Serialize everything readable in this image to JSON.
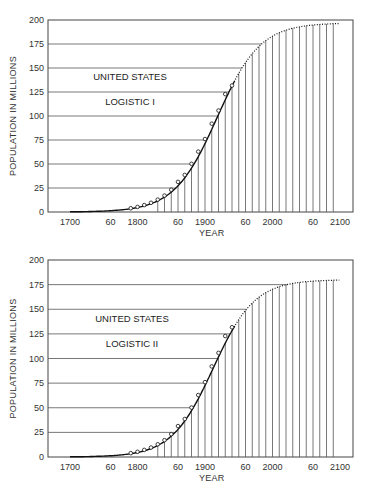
{
  "chart_data": [
    {
      "type": "line",
      "title": "UNITED STATES",
      "subtitle": "LOGISTIC I",
      "xlabel": "YEAR",
      "ylabel": "POPULATION IN MILLIONS",
      "xlim": [
        1690,
        2110
      ],
      "ylim": [
        0,
        200
      ],
      "yticks": [
        0,
        25,
        50,
        75,
        100,
        125,
        150,
        175,
        200
      ],
      "xtick_labels": [
        {
          "x": 1700,
          "label": "1700"
        },
        {
          "x": 1760,
          "label": "60"
        },
        {
          "x": 1800,
          "label": "1800"
        },
        {
          "x": 1860,
          "label": "60"
        },
        {
          "x": 1900,
          "label": "1900"
        },
        {
          "x": 1960,
          "label": "60"
        },
        {
          "x": 2000,
          "label": "2000"
        },
        {
          "x": 2060,
          "label": "60"
        },
        {
          "x": 2100,
          "label": "2100"
        }
      ],
      "grid": true,
      "asymptote": 197,
      "observed": {
        "x": [
          1790,
          1800,
          1810,
          1820,
          1830,
          1840,
          1850,
          1860,
          1870,
          1880,
          1890,
          1900,
          1910,
          1920,
          1930,
          1940
        ],
        "y": [
          3.9,
          5.3,
          7.2,
          9.6,
          12.9,
          17.1,
          23.2,
          31.4,
          38.6,
          50.2,
          62.9,
          76.0,
          92.0,
          105.7,
          122.8,
          131.7
        ]
      },
      "fitted_solid_range": [
        1700,
        1945
      ],
      "fitted_dotted_range": [
        1945,
        2100
      ]
    },
    {
      "type": "line",
      "title": "UNITED STATES",
      "subtitle": "LOGISTIC II",
      "xlabel": "YEAR",
      "ylabel": "POPULATION IN MILLIONS",
      "xlim": [
        1690,
        2110
      ],
      "ylim": [
        0,
        200
      ],
      "yticks": [
        0,
        25,
        50,
        75,
        100,
        125,
        150,
        175,
        200
      ],
      "xtick_labels": [
        {
          "x": 1700,
          "label": "1700"
        },
        {
          "x": 1760,
          "label": "60"
        },
        {
          "x": 1800,
          "label": "1800"
        },
        {
          "x": 1860,
          "label": "60"
        },
        {
          "x": 1900,
          "label": "1900"
        },
        {
          "x": 1960,
          "label": "60"
        },
        {
          "x": 2000,
          "label": "2000"
        },
        {
          "x": 2060,
          "label": "60"
        },
        {
          "x": 2100,
          "label": "2100"
        }
      ],
      "grid": true,
      "asymptote": 180,
      "observed": {
        "x": [
          1790,
          1800,
          1810,
          1820,
          1830,
          1840,
          1850,
          1860,
          1870,
          1880,
          1890,
          1900,
          1910,
          1920,
          1930,
          1940
        ],
        "y": [
          3.9,
          5.3,
          7.2,
          9.6,
          12.9,
          17.1,
          23.2,
          31.4,
          38.6,
          50.2,
          62.9,
          76.0,
          92.0,
          105.7,
          122.8,
          131.7
        ]
      },
      "fitted_solid_range": [
        1700,
        1945
      ],
      "fitted_dotted_range": [
        1945,
        2100
      ]
    }
  ],
  "charts": [
    {
      "title": "UNITED STATES",
      "subtitle": "LOGISTIC I",
      "xlabel": "YEAR",
      "ylabel": "POPULATION IN MILLIONS"
    },
    {
      "title": "UNITED STATES",
      "subtitle": "LOGISTIC II",
      "xlabel": "YEAR",
      "ylabel": "POPULATION IN MILLIONS"
    }
  ]
}
